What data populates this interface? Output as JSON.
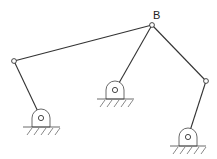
{
  "diagram": {
    "type": "linkage-mechanism",
    "labels": {
      "B": "B"
    },
    "joints": {
      "B": {
        "x": 152,
        "y": 25
      },
      "left": {
        "x": 14,
        "y": 61
      },
      "right": {
        "x": 206,
        "y": 81
      }
    },
    "pivots": [
      {
        "id": "left-pivot",
        "x": 41,
        "y": 118,
        "base_y": 127
      },
      {
        "id": "middle-pivot",
        "x": 115,
        "y": 90,
        "base_y": 99
      },
      {
        "id": "right-pivot",
        "x": 188,
        "y": 137,
        "base_y": 146
      }
    ],
    "colors": {
      "line": "#333333",
      "background": "#ffffff"
    }
  }
}
